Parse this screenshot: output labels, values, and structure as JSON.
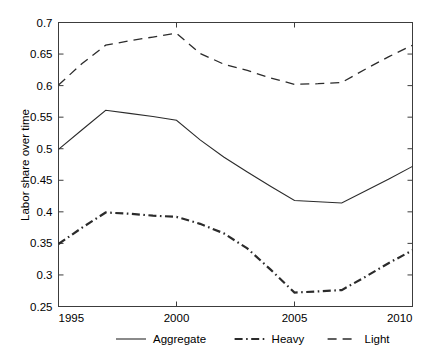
{
  "chart_data": {
    "type": "line",
    "title": "",
    "xlabel": "",
    "ylabel": "Labor share over time",
    "xlim": [
      1995,
      2010
    ],
    "ylim": [
      0.25,
      0.7
    ],
    "grid": false,
    "legend_position": "bottom-outside",
    "x": [
      1995,
      1996,
      1997,
      1998,
      1999,
      2000,
      2001,
      2002,
      2003,
      2004,
      2005,
      2006,
      2007,
      2008,
      2009,
      2010
    ],
    "xticks": [
      1995,
      2000,
      2005,
      2010
    ],
    "xtick_labels": [
      "1995",
      "2000",
      "2005",
      "2010"
    ],
    "yticks": [
      0.25,
      0.3,
      0.35,
      0.4,
      0.45,
      0.5,
      0.55,
      0.6,
      0.65,
      0.7
    ],
    "ytick_labels": [
      "0.25",
      "0.3",
      "0.35",
      "0.4",
      "0.45",
      "0.5",
      "0.55",
      "0.6",
      "0.65",
      "0.7"
    ],
    "series": [
      {
        "name": "Aggregate",
        "style": "solid",
        "color": "#2b2b2b",
        "values": [
          0.499,
          0.53,
          0.561,
          0.556,
          0.551,
          0.545,
          0.514,
          0.487,
          0.463,
          0.44,
          0.418,
          0.416,
          0.414,
          0.433,
          0.452,
          0.472
        ]
      },
      {
        "name": "Heavy",
        "style": "dash-dot",
        "color": "#2b2b2b",
        "values": [
          0.349,
          0.375,
          0.399,
          0.397,
          0.394,
          0.392,
          0.381,
          0.366,
          0.342,
          0.308,
          0.272,
          0.274,
          0.276,
          0.297,
          0.319,
          0.339
        ]
      },
      {
        "name": "Light",
        "style": "dashed",
        "color": "#2b2b2b",
        "values": [
          0.601,
          0.635,
          0.664,
          0.671,
          0.677,
          0.683,
          0.651,
          0.634,
          0.624,
          0.612,
          0.602,
          0.603,
          0.605,
          0.626,
          0.646,
          0.664
        ]
      }
    ]
  },
  "legend": {
    "items": [
      {
        "label": "Aggregate",
        "style": "solid"
      },
      {
        "label": "Heavy",
        "style": "dash-dot"
      },
      {
        "label": "Light",
        "style": "dashed"
      }
    ]
  }
}
